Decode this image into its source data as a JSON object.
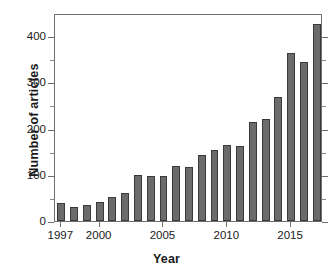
{
  "chart_data": {
    "type": "bar",
    "title": "",
    "xlabel": "Year",
    "ylabel": "Number of articles",
    "categories": [
      "1997",
      "1998",
      "1999",
      "2000",
      "2001",
      "2002",
      "2003",
      "2004",
      "2005",
      "2006",
      "2007",
      "2008",
      "2009",
      "2010",
      "2011",
      "2012",
      "2013",
      "2014",
      "2015",
      "2016",
      "2017"
    ],
    "values": [
      39,
      30,
      35,
      42,
      51,
      60,
      99,
      97,
      97,
      118,
      117,
      142,
      153,
      164,
      163,
      215,
      221,
      268,
      364,
      344,
      427
    ],
    "ylim": [
      0,
      450
    ],
    "xlim": [
      1996.5,
      2017.5
    ],
    "y_major_ticks": [
      0,
      100,
      200,
      300,
      400
    ],
    "y_major_tick_labels": [
      "0",
      "100",
      "200",
      "300",
      "400"
    ],
    "y_minor_ticks": [
      50,
      150,
      250,
      350
    ],
    "x_tick_values": [
      1997,
      2000,
      2005,
      2010,
      2015
    ],
    "x_tick_labels": [
      "1997",
      "2000",
      "2005",
      "2010",
      "2015"
    ],
    "grid": false,
    "legend": null,
    "bar_color": "#6b6b6b",
    "bar_edge_color": "#3a3a3a",
    "axis_color": "#6f6f6f",
    "background_color": "#ffffff"
  }
}
